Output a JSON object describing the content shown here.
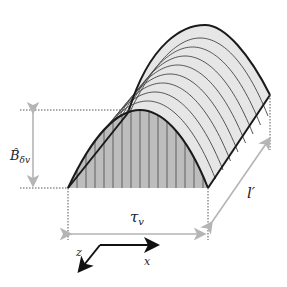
{
  "diagram": {
    "type": "3d-sinusoidal-flux-density-prism",
    "labels": {
      "amplitude": "B̂",
      "amplitude_sub": "δv",
      "pole_pitch": "τ",
      "pole_pitch_sub": "v",
      "length": "l′",
      "axis_x": "x",
      "axis_z": "z"
    },
    "colors": {
      "outline": "#1a1a1a",
      "front_fill": "#bdbdbd",
      "top_fill": "#e6e6e6",
      "hatch": "#555555",
      "dimension": "#b5b5b5",
      "dotted": "#555555"
    },
    "counts": {
      "front_hatch_lines": 15,
      "surface_contours": 8
    }
  }
}
